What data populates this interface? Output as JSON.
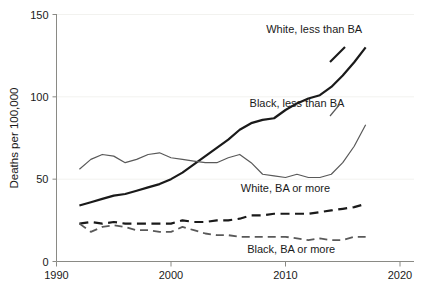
{
  "chart_data": {
    "type": "line",
    "title": "",
    "subtitle": "",
    "xlabel": "",
    "ylabel": "Deaths per 100,000",
    "xlim": [
      1990,
      2020
    ],
    "ylim": [
      0,
      150
    ],
    "xticks": [
      1990,
      2000,
      2010,
      2020
    ],
    "yticks": [
      0,
      50,
      100,
      150
    ],
    "xtick_labels": [
      "1990",
      "2000",
      "2010",
      "2020"
    ],
    "ytick_labels": [
      "0",
      "50",
      "100",
      "150"
    ],
    "grid": "horizontal-faint",
    "legend": "inline-annotations",
    "x": [
      1992,
      1993,
      1994,
      1995,
      1996,
      1997,
      1998,
      1999,
      2000,
      2001,
      2002,
      2003,
      2004,
      2005,
      2006,
      2007,
      2008,
      2009,
      2010,
      2011,
      2012,
      2013,
      2014,
      2015,
      2016,
      2017
    ],
    "series": [
      {
        "name": "White, less than BA",
        "style": "solid-black",
        "color": "#1a1a1a",
        "width": 2.2,
        "values": [
          34,
          36,
          38,
          40,
          41,
          43,
          45,
          47,
          50,
          54,
          59,
          64,
          69,
          74,
          80,
          84,
          86,
          87,
          92,
          96,
          99,
          101,
          106,
          113,
          121,
          130
        ],
        "label_x": 2012.5,
        "label_y": 139
      },
      {
        "name": "Black, less than BA",
        "style": "solid-gray",
        "color": "#595959",
        "width": 1.2,
        "values": [
          56,
          62,
          65,
          64,
          60,
          62,
          65,
          66,
          63,
          62,
          61,
          60,
          60,
          63,
          65,
          60,
          53,
          52,
          51,
          53,
          51,
          51,
          53,
          60,
          70,
          83
        ],
        "label_x": 2011.0,
        "label_y": 94
      },
      {
        "name": "White, BA or more",
        "style": "dashed-black",
        "color": "#1a1a1a",
        "width": 2.2,
        "values": [
          23,
          24,
          23,
          24,
          23,
          23,
          23,
          23,
          23,
          25,
          24,
          24,
          25,
          25,
          26,
          28,
          28,
          29,
          29,
          29,
          29,
          30,
          31,
          32,
          33,
          35
        ],
        "label_x": 2010.0,
        "label_y": 42
      },
      {
        "name": "Black, BA or more",
        "style": "dashed-gray",
        "color": "#595959",
        "width": 1.8,
        "values": [
          23,
          18,
          21,
          22,
          21,
          19,
          19,
          18,
          18,
          21,
          19,
          17,
          16,
          16,
          15,
          15,
          15,
          15,
          15,
          14,
          13,
          14,
          13,
          13,
          15,
          15
        ],
        "label_x": 2010.5,
        "label_y": 5
      }
    ]
  }
}
